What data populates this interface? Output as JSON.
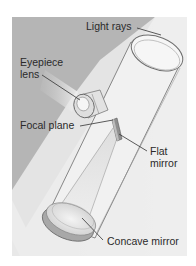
{
  "diagram": {
    "labels": {
      "light_rays": "Light rays",
      "eyepiece_line1": "Eyepiece",
      "eyepiece_line2": "lens",
      "focal_plane": "Focal plane",
      "flat_line1": "Flat",
      "flat_line2": "mirror",
      "concave_mirror": "Concave mirror"
    },
    "colors": {
      "page_background": "#ffffff",
      "panel_background": "#b5b5b5",
      "light_band": "#efefef",
      "tube_outline": "#6e6e6e",
      "label_text": "#2a2a2a"
    }
  }
}
